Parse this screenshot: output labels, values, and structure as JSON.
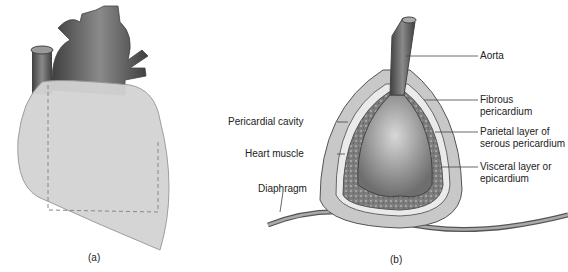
{
  "figure_a": {
    "caption": "(a)"
  },
  "figure_b": {
    "caption": "(b)",
    "labels": {
      "aorta": "Aorta",
      "fibrous_1": "Fibrous",
      "fibrous_2": "pericardium",
      "parietal_1": "Parietal layer of",
      "parietal_2": "serous pericardium",
      "visceral_1": "Visceral layer or",
      "visceral_2": "epicardium",
      "pericardial_cavity": "Pericardial cavity",
      "heart_muscle": "Heart muscle",
      "diaphragm": "Diaphragm"
    }
  },
  "colors": {
    "vessel_dark": "#5a5a5a",
    "pericardium": "#c8c8c8",
    "heart_fill": "#d0d0d0",
    "muscle": "#8a8a8a",
    "text": "#222222"
  }
}
